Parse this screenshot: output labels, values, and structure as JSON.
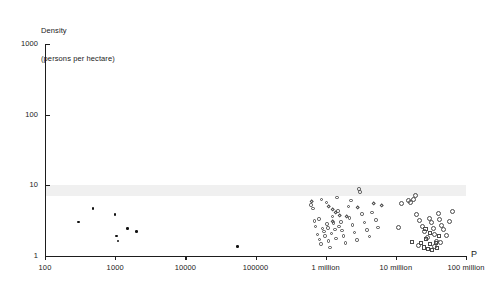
{
  "chart_data": {
    "type": "scatter",
    "title": "",
    "ylabel": "Density\n(persons per hectare)",
    "ylabel_line1": "Density",
    "ylabel_line2": "(persons per hectare)",
    "xlabel": "P",
    "xscale": "log",
    "yscale": "log",
    "xlim": [
      100,
      100000000
    ],
    "ylim": [
      1,
      1000
    ],
    "grid": false,
    "legend": "none",
    "xticks": [
      100,
      1000,
      10000,
      100000,
      1000000,
      10000000,
      100000000
    ],
    "xticklabels": [
      "100",
      "1000",
      "10000",
      "100000",
      "1 million",
      "10 million",
      "100 million"
    ],
    "yticks": [
      1,
      10,
      100,
      1000
    ],
    "yticklabels": [
      "1",
      "10",
      "100",
      "1000"
    ],
    "annotations": [
      {
        "name": "highlight-band",
        "type": "hspan",
        "y_from": 7.0,
        "y_to": 10.0,
        "color": "#f0f0f0"
      }
    ],
    "series": [
      {
        "name": "filled-dots",
        "marker": "filled-circle",
        "color": "#111111",
        "points": [
          {
            "x": 300,
            "y": 3.0
          },
          {
            "x": 480,
            "y": 4.6
          },
          {
            "x": 1000,
            "y": 3.8
          },
          {
            "x": 1050,
            "y": 1.9
          },
          {
            "x": 1100,
            "y": 1.6
          },
          {
            "x": 1500,
            "y": 2.4
          },
          {
            "x": 2000,
            "y": 2.2
          },
          {
            "x": 55000,
            "y": 1.35
          }
        ]
      },
      {
        "name": "mid-cluster-circles",
        "marker": "open-circle",
        "color": "#4a4a4a",
        "points": [
          {
            "x": 620000,
            "y": 5.2
          },
          {
            "x": 660000,
            "y": 4.6
          },
          {
            "x": 700000,
            "y": 3.1
          },
          {
            "x": 720000,
            "y": 2.6
          },
          {
            "x": 760000,
            "y": 2.0
          },
          {
            "x": 800000,
            "y": 3.3
          },
          {
            "x": 820000,
            "y": 1.7
          },
          {
            "x": 860000,
            "y": 1.45
          },
          {
            "x": 900000,
            "y": 2.4
          },
          {
            "x": 950000,
            "y": 2.2
          },
          {
            "x": 980000,
            "y": 1.9
          },
          {
            "x": 1020000,
            "y": 5.6
          },
          {
            "x": 1050000,
            "y": 2.8
          },
          {
            "x": 1080000,
            "y": 2.45
          },
          {
            "x": 1100000,
            "y": 1.6
          },
          {
            "x": 1150000,
            "y": 1.3
          },
          {
            "x": 1200000,
            "y": 2.05
          },
          {
            "x": 1250000,
            "y": 3.6
          },
          {
            "x": 1300000,
            "y": 2.9
          },
          {
            "x": 1350000,
            "y": 2.35
          },
          {
            "x": 1400000,
            "y": 1.75
          },
          {
            "x": 1500000,
            "y": 4.3
          },
          {
            "x": 1550000,
            "y": 2.6
          },
          {
            "x": 1650000,
            "y": 3.0
          },
          {
            "x": 1700000,
            "y": 2.25
          },
          {
            "x": 1800000,
            "y": 1.9
          },
          {
            "x": 1900000,
            "y": 1.5
          },
          {
            "x": 2100000,
            "y": 5.0
          },
          {
            "x": 2200000,
            "y": 3.4
          },
          {
            "x": 2400000,
            "y": 2.7
          },
          {
            "x": 2600000,
            "y": 2.1
          },
          {
            "x": 2800000,
            "y": 1.65
          },
          {
            "x": 3000000,
            "y": 8.8
          },
          {
            "x": 3100000,
            "y": 8.0
          },
          {
            "x": 3300000,
            "y": 3.9
          },
          {
            "x": 3600000,
            "y": 2.95
          },
          {
            "x": 3900000,
            "y": 2.3
          },
          {
            "x": 4200000,
            "y": 1.85
          },
          {
            "x": 4600000,
            "y": 4.1
          },
          {
            "x": 5200000,
            "y": 3.2
          },
          {
            "x": 5600000,
            "y": 2.5
          },
          {
            "x": 880000,
            "y": 6.2
          },
          {
            "x": 1450000,
            "y": 6.6
          },
          {
            "x": 2300000,
            "y": 6.0
          }
        ]
      },
      {
        "name": "mid-cluster-diamonds",
        "marker": "open-diamond",
        "color": "#4a4a4a",
        "points": [
          {
            "x": 640000,
            "y": 5.8
          },
          {
            "x": 1120000,
            "y": 4.9
          },
          {
            "x": 1280000,
            "y": 4.4
          },
          {
            "x": 1380000,
            "y": 4.0
          },
          {
            "x": 1600000,
            "y": 3.7
          },
          {
            "x": 2000000,
            "y": 3.5
          },
          {
            "x": 2900000,
            "y": 4.7
          },
          {
            "x": 4900000,
            "y": 5.4
          },
          {
            "x": 6200000,
            "y": 5.1
          },
          {
            "x": 1250000,
            "y": 3.05
          }
        ]
      },
      {
        "name": "right-cluster-circles",
        "marker": "open-circle",
        "color": "#4a4a4a",
        "points": [
          {
            "x": 12000000,
            "y": 5.5
          },
          {
            "x": 15000000,
            "y": 6.0
          },
          {
            "x": 16000000,
            "y": 5.6
          },
          {
            "x": 18000000,
            "y": 6.3
          },
          {
            "x": 20000000,
            "y": 3.8
          },
          {
            "x": 22000000,
            "y": 3.1
          },
          {
            "x": 24000000,
            "y": 2.6
          },
          {
            "x": 26000000,
            "y": 2.2
          },
          {
            "x": 28000000,
            "y": 1.8
          },
          {
            "x": 30000000,
            "y": 3.4
          },
          {
            "x": 32000000,
            "y": 2.9
          },
          {
            "x": 34000000,
            "y": 2.4
          },
          {
            "x": 36000000,
            "y": 2.0
          },
          {
            "x": 38000000,
            "y": 1.6
          },
          {
            "x": 40000000,
            "y": 4.0
          },
          {
            "x": 42000000,
            "y": 3.2
          },
          {
            "x": 45000000,
            "y": 2.7
          },
          {
            "x": 48000000,
            "y": 2.3
          },
          {
            "x": 52000000,
            "y": 1.9
          },
          {
            "x": 58000000,
            "y": 3.0
          },
          {
            "x": 11000000,
            "y": 2.5
          },
          {
            "x": 19000000,
            "y": 7.2
          },
          {
            "x": 65000000,
            "y": 4.2
          },
          {
            "x": 21000000,
            "y": 1.4
          },
          {
            "x": 35000000,
            "y": 1.35
          },
          {
            "x": 44000000,
            "y": 1.55
          }
        ]
      },
      {
        "name": "right-cluster-squares",
        "marker": "open-square",
        "color": "#4a4a4a",
        "points": [
          {
            "x": 23000000,
            "y": 1.5
          },
          {
            "x": 25000000,
            "y": 1.3
          },
          {
            "x": 27000000,
            "y": 1.7
          },
          {
            "x": 29000000,
            "y": 1.25
          },
          {
            "x": 31000000,
            "y": 1.45
          },
          {
            "x": 33000000,
            "y": 1.2
          },
          {
            "x": 37000000,
            "y": 1.5
          },
          {
            "x": 39000000,
            "y": 1.28
          },
          {
            "x": 41000000,
            "y": 1.9
          },
          {
            "x": 30500000,
            "y": 2.1
          },
          {
            "x": 26500000,
            "y": 2.4
          },
          {
            "x": 17000000,
            "y": 1.55
          }
        ]
      }
    ]
  },
  "caption": ""
}
